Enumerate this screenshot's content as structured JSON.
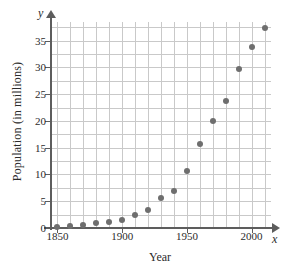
{
  "chart_data": {
    "type": "scatter",
    "title": "",
    "xlabel": "Year",
    "ylabel": "Population (in millions)",
    "x_axis_symbol": "x",
    "y_axis_symbol": "y",
    "xlim": [
      1845,
      2015
    ],
    "ylim": [
      0,
      38.5
    ],
    "xticks": [
      1850,
      1900,
      1950,
      2000
    ],
    "yticks": [
      0,
      5,
      10,
      15,
      20,
      25,
      30,
      35
    ],
    "grid": true,
    "grid_x_step": 10,
    "grid_y_step": 2.5,
    "legend": "none",
    "point_color": "#6e6e6e",
    "axis_color": "#5d5d5d",
    "grid_color": "#c9c9c9",
    "x": [
      1850,
      1860,
      1870,
      1880,
      1890,
      1900,
      1910,
      1920,
      1930,
      1940,
      1950,
      1960,
      1970,
      1980,
      1990,
      2000,
      2010
    ],
    "values": [
      0.1,
      0.4,
      0.6,
      0.9,
      1.2,
      1.5,
      2.4,
      3.4,
      5.7,
      6.9,
      10.6,
      15.7,
      20.0,
      23.7,
      29.8,
      33.9,
      37.3
    ]
  }
}
